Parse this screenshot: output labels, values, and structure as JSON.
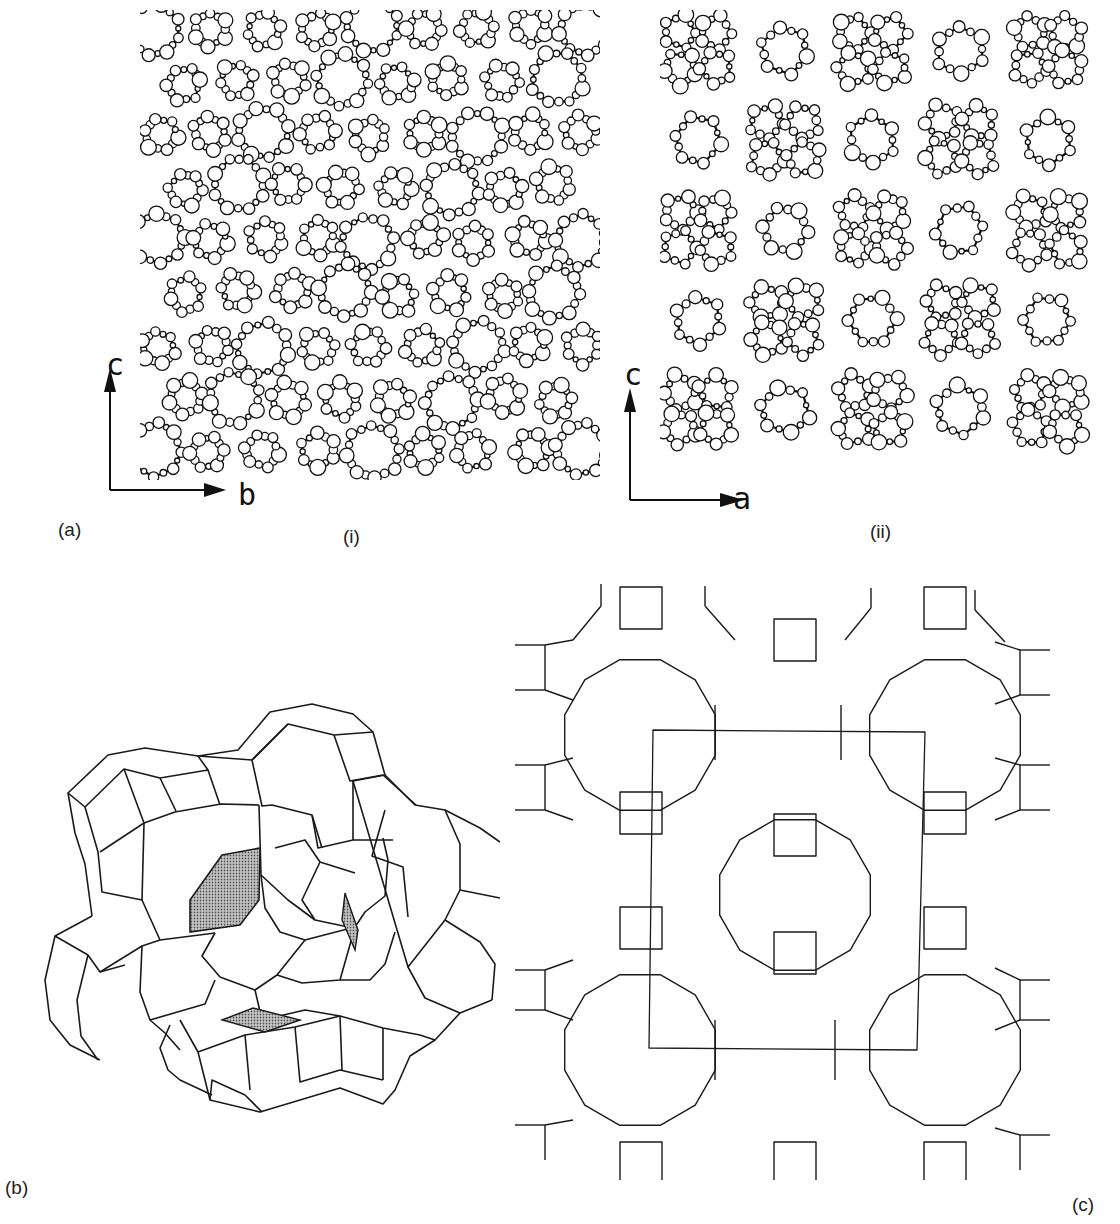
{
  "figure": {
    "panel_a": {
      "label": "(a)",
      "sub_i": {
        "label": "(i)",
        "axis_vertical": "c",
        "axis_horizontal": "b",
        "description": "Atomic framework projection viewed down a (ball-and-stick)"
      },
      "sub_ii": {
        "label": "(ii)",
        "axis_vertical": "c",
        "axis_horizontal": "a",
        "description": "Atomic framework projection viewed down b (ball-and-stick)"
      }
    },
    "panel_b": {
      "label": "(b)",
      "description": "3D polyhedral cage (cavity) with shaded window faces",
      "shade_color": "#8a8a8a"
    },
    "panel_c": {
      "label": "(c)",
      "description": "2D framework net of 4-, 6- and 8/12-rings with unit-cell outline"
    },
    "colors": {
      "ink": "#1a1a1a",
      "background": "#ffffff"
    }
  }
}
